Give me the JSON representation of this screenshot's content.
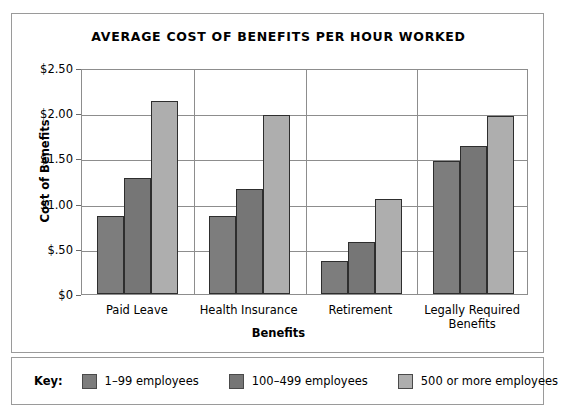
{
  "chart_data": {
    "type": "bar",
    "title": "Average Cost of Benefits per Hour Worked",
    "xlabel": "Benefits",
    "ylabel": "Cost of Benefits",
    "categories": [
      "Paid Leave",
      "Health Insurance",
      "Retirement",
      "Legally Required Benefits"
    ],
    "category_lines": [
      [
        "Paid Leave"
      ],
      [
        "Health Insurance"
      ],
      [
        "Retirement"
      ],
      [
        "Legally Required",
        "Benefits"
      ]
    ],
    "series": [
      {
        "name": "1–99 employees",
        "color": "#7d7d7d",
        "values": [
          0.86,
          0.86,
          0.36,
          1.47
        ]
      },
      {
        "name": "100–499 employees",
        "color": "#767676",
        "values": [
          1.28,
          1.16,
          0.57,
          1.64
        ]
      },
      {
        "name": "500 or more employees",
        "color": "#aeaeae",
        "values": [
          2.14,
          1.98,
          1.05,
          1.97
        ]
      }
    ],
    "ylim": [
      0,
      2.5
    ],
    "yticks": [
      0,
      0.5,
      1.0,
      1.5,
      2.0,
      2.5
    ],
    "ytick_labels": [
      "$0",
      "$.50",
      "$1.00",
      "$1.50",
      "$2.00",
      "$2.50"
    ],
    "grid": true,
    "legend_position": "bottom"
  },
  "key": {
    "label": "Key:"
  }
}
